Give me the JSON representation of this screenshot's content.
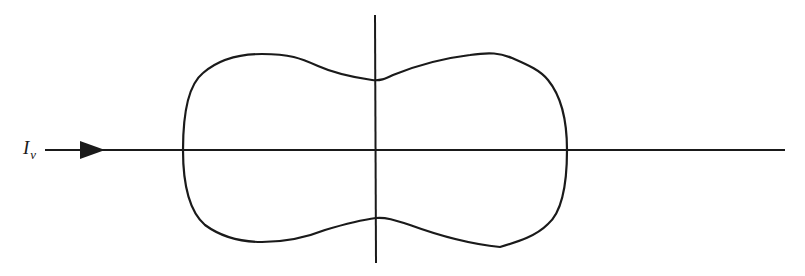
{
  "diagram": {
    "incident_label": {
      "main": "I",
      "subscript": "ν"
    },
    "colors": {
      "stroke": "#1a1a1a",
      "background": "#ffffff"
    },
    "elements": [
      "horizontal axis with incident arrow",
      "vertical axis",
      "closed lobed scattering pattern curve"
    ]
  }
}
